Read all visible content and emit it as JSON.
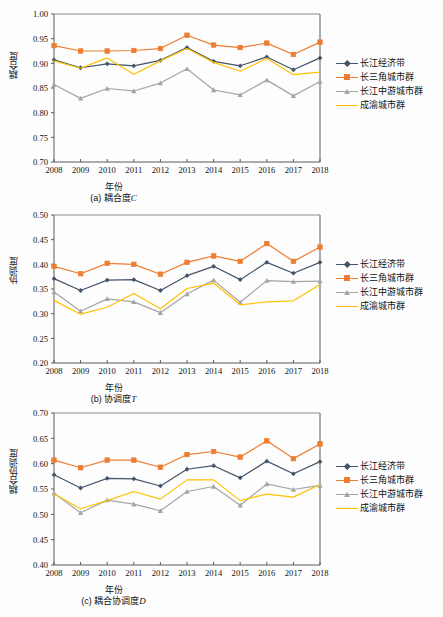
{
  "figure": {
    "xlabel": "年份",
    "years": [
      2008,
      2009,
      2010,
      2011,
      2012,
      2013,
      2014,
      2015,
      2016,
      2017,
      2018
    ],
    "legend": [
      {
        "name": "长江经济带",
        "color": "#44546a",
        "marker": "diamond"
      },
      {
        "name": "长三角城市群",
        "color": "#ed7d31",
        "marker": "square"
      },
      {
        "name": "长江中游城市群",
        "color": "#a5a5a5",
        "marker": "triangle"
      },
      {
        "name": "成渝城市群",
        "color": "#ffc000",
        "marker": "none"
      }
    ]
  },
  "chart_data": [
    {
      "id": "a",
      "type": "line",
      "title": "(a) 耦合度C",
      "caption_prefix": "(a) 耦合度",
      "caption_italic": "C",
      "xlabel": "年份",
      "ylabel": "耦合度",
      "x": [
        2008,
        2009,
        2010,
        2011,
        2012,
        2013,
        2014,
        2015,
        2016,
        2017,
        2018
      ],
      "ylim": [
        0.7,
        1.0
      ],
      "yticks": [
        "0.70",
        "0.75",
        "0.80",
        "0.85",
        "0.90",
        "0.95",
        "1.00"
      ],
      "ytickvals": [
        0.7,
        0.75,
        0.8,
        0.85,
        0.9,
        0.95,
        1.0
      ],
      "grid": false,
      "legend_position": "right",
      "series": [
        {
          "name": "长江经济带",
          "color": "#44546a",
          "marker": "diamond",
          "values": [
            0.907,
            0.891,
            0.899,
            0.895,
            0.906,
            0.932,
            0.904,
            0.895,
            0.913,
            0.887,
            0.911
          ]
        },
        {
          "name": "长三角城市群",
          "color": "#ed7d31",
          "marker": "square",
          "values": [
            0.936,
            0.925,
            0.925,
            0.926,
            0.93,
            0.957,
            0.937,
            0.932,
            0.941,
            0.918,
            0.943
          ]
        },
        {
          "name": "长江中游城市群",
          "color": "#a5a5a5",
          "marker": "triangle",
          "values": [
            0.857,
            0.829,
            0.849,
            0.844,
            0.86,
            0.889,
            0.846,
            0.836,
            0.866,
            0.834,
            0.863
          ]
        },
        {
          "name": "成渝城市群",
          "color": "#ffc000",
          "marker": "none",
          "values": [
            0.905,
            0.89,
            0.911,
            0.878,
            0.905,
            0.93,
            0.902,
            0.884,
            0.91,
            0.877,
            0.882
          ]
        }
      ]
    },
    {
      "id": "b",
      "type": "line",
      "title": "(b) 协调度T",
      "caption_prefix": "(b) 协调度",
      "caption_italic": "T",
      "xlabel": "年份",
      "ylabel": "协调度",
      "x": [
        2008,
        2009,
        2010,
        2011,
        2012,
        2013,
        2014,
        2015,
        2016,
        2017,
        2018
      ],
      "ylim": [
        0.2,
        0.5
      ],
      "yticks": [
        "0.20",
        "0.25",
        "0.30",
        "0.35",
        "0.40",
        "0.45",
        "0.50"
      ],
      "ytickvals": [
        0.2,
        0.25,
        0.3,
        0.35,
        0.4,
        0.45,
        0.5
      ],
      "grid": false,
      "legend_position": "right",
      "series": [
        {
          "name": "长江经济带",
          "color": "#44546a",
          "marker": "diamond",
          "values": [
            0.371,
            0.347,
            0.368,
            0.369,
            0.347,
            0.377,
            0.396,
            0.369,
            0.404,
            0.382,
            0.404
          ]
        },
        {
          "name": "长三角城市群",
          "color": "#ed7d31",
          "marker": "square",
          "values": [
            0.396,
            0.381,
            0.402,
            0.4,
            0.38,
            0.404,
            0.417,
            0.406,
            0.442,
            0.406,
            0.435
          ]
        },
        {
          "name": "长江中游城市群",
          "color": "#a5a5a5",
          "marker": "triangle",
          "values": [
            0.344,
            0.305,
            0.33,
            0.324,
            0.302,
            0.34,
            0.368,
            0.323,
            0.367,
            0.365,
            0.366
          ]
        },
        {
          "name": "成渝城市群",
          "color": "#ffc000",
          "marker": "none",
          "values": [
            0.327,
            0.299,
            0.313,
            0.341,
            0.31,
            0.351,
            0.362,
            0.318,
            0.324,
            0.326,
            0.359
          ]
        }
      ]
    },
    {
      "id": "c",
      "type": "line",
      "title": "(c) 耦合协调度D",
      "caption_prefix": "(c) 耦合协调度",
      "caption_italic": "D",
      "xlabel": "年份",
      "ylabel": "耦合协调度",
      "x": [
        2008,
        2009,
        2010,
        2011,
        2012,
        2013,
        2014,
        2015,
        2016,
        2017,
        2018
      ],
      "ylim": [
        0.4,
        0.7
      ],
      "yticks": [
        "0.40",
        "0.45",
        "0.50",
        "0.55",
        "0.60",
        "0.65",
        "0.70"
      ],
      "ytickvals": [
        0.4,
        0.45,
        0.5,
        0.55,
        0.6,
        0.65,
        0.7
      ],
      "grid": false,
      "legend_position": "right",
      "series": [
        {
          "name": "长江经济带",
          "color": "#44546a",
          "marker": "diamond",
          "values": [
            0.578,
            0.552,
            0.571,
            0.57,
            0.556,
            0.589,
            0.596,
            0.572,
            0.605,
            0.58,
            0.604
          ]
        },
        {
          "name": "长三角城市群",
          "color": "#ed7d31",
          "marker": "square",
          "values": [
            0.607,
            0.592,
            0.607,
            0.607,
            0.593,
            0.618,
            0.624,
            0.613,
            0.645,
            0.61,
            0.639
          ]
        },
        {
          "name": "长江中游城市群",
          "color": "#a5a5a5",
          "marker": "triangle",
          "values": [
            0.542,
            0.503,
            0.528,
            0.52,
            0.507,
            0.545,
            0.555,
            0.518,
            0.56,
            0.549,
            0.557
          ]
        },
        {
          "name": "成渝城市群",
          "color": "#ffc000",
          "marker": "none",
          "values": [
            0.54,
            0.511,
            0.527,
            0.545,
            0.53,
            0.568,
            0.568,
            0.527,
            0.54,
            0.534,
            0.559
          ]
        }
      ]
    }
  ]
}
